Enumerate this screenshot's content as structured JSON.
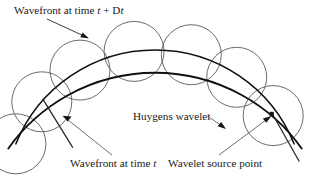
{
  "figure": {
    "title_alt": "Huygens principle wavefront construction",
    "labels": {
      "wavefront_later": {
        "prefix": "Wavefront at time ",
        "var1": "t",
        "operator": " + D",
        "var2": "t"
      },
      "wavefront_now": {
        "prefix": "Wavefront at time ",
        "var1": "t"
      },
      "huygens_wavelet": "Huygens wavelet",
      "wavelet_source_point": "Wavelet source point"
    },
    "colors": {
      "wavefront_stroke": "#101010",
      "wavelet_stroke": "#5a5a5a",
      "leader_stroke": "#555555",
      "text": "#1a1a1a",
      "background": "#ffffff"
    },
    "geometry": {
      "center_x": 155,
      "center_y": 200,
      "inner_radius": 150,
      "outer_radius": 180,
      "wavelet_radius": 30,
      "wavelet_count": 7,
      "wavelet_angles_deg": [
        202,
        221,
        240,
        262,
        284,
        303,
        322
      ]
    }
  }
}
